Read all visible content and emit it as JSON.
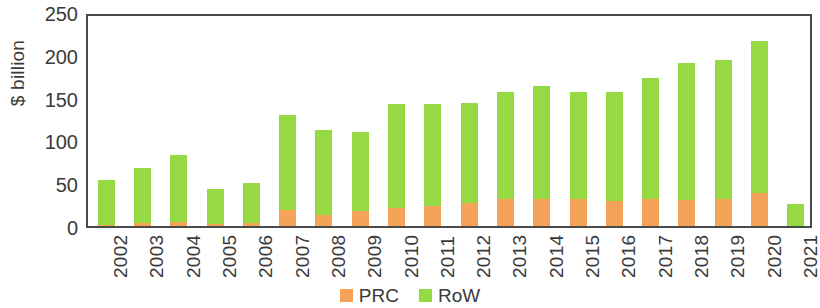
{
  "chart_data": {
    "type": "bar",
    "subtype": "stacked-column",
    "title": "",
    "xlabel": "",
    "ylabel": "$ billion",
    "ylim": [
      0,
      250
    ],
    "yticks": [
      0,
      50,
      100,
      150,
      200,
      250
    ],
    "ytick_labels": [
      "0",
      "50",
      "100",
      "150",
      "200",
      "250"
    ],
    "grid": false,
    "legend_position": "bottom-center",
    "categories": [
      "2002",
      "2003",
      "2004",
      "2005",
      "2006",
      "2007",
      "2008",
      "2009",
      "2010",
      "2011",
      "2012",
      "2013",
      "2014",
      "2015",
      "2016",
      "2017",
      "2018",
      "2019",
      "2020",
      "2021"
    ],
    "series": [
      {
        "name": "PRC",
        "color": "#f4a358",
        "values": [
          1,
          4,
          5,
          2,
          3,
          19,
          13,
          17,
          21,
          23,
          27,
          31,
          31,
          31,
          29,
          31,
          30,
          32,
          38,
          0
        ]
      },
      {
        "name": "RoW",
        "color": "#95d944",
        "values": [
          53,
          64,
          78,
          41,
          47,
          111,
          99,
          93,
          121,
          119,
          117,
          126,
          133,
          126,
          127,
          142,
          161,
          162,
          178,
          26
        ]
      }
    ],
    "totals": [
      54,
      68,
      83,
      43,
      50,
      130,
      112,
      110,
      142,
      142,
      144,
      157,
      164,
      157,
      156,
      173,
      191,
      194,
      216,
      26
    ]
  },
  "legend": {
    "items": [
      {
        "label": "PRC",
        "color": "#f4a358",
        "swatch_icon": "square-swatch-icon"
      },
      {
        "label": "RoW",
        "color": "#95d944",
        "swatch_icon": "square-swatch-icon"
      }
    ]
  },
  "axes": {
    "y_title": "$ billion"
  }
}
